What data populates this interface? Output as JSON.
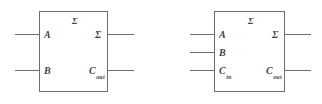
{
  "figure": {
    "type": "logic-block-diagram",
    "background_color": "#ffffff",
    "line_color": "#6e6e6e",
    "text_color": "#3f3f3f"
  },
  "blocks": [
    {
      "id": "half-adder",
      "name": "Half Adder",
      "inner_label": "Σ",
      "inputs": [
        {
          "label": "A",
          "sub": ""
        },
        {
          "label": "B",
          "sub": ""
        }
      ],
      "outputs": [
        {
          "label": "Σ",
          "sub": ""
        },
        {
          "label": "C",
          "sub": "out"
        }
      ]
    },
    {
      "id": "full-adder",
      "name": "Full Adder",
      "inner_label": "Σ",
      "inputs": [
        {
          "label": "A",
          "sub": ""
        },
        {
          "label": "B",
          "sub": ""
        },
        {
          "label": "C",
          "sub": "in"
        }
      ],
      "outputs": [
        {
          "label": "Σ",
          "sub": ""
        },
        {
          "label": "C",
          "sub": "out"
        }
      ]
    }
  ]
}
